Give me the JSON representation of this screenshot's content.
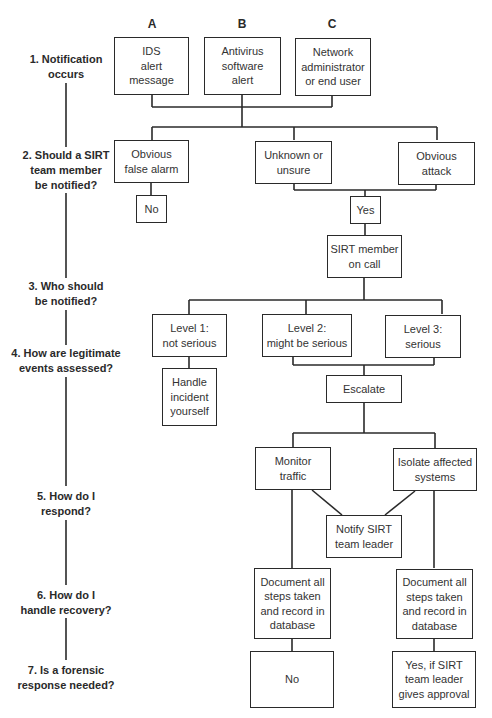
{
  "columns": [
    "A",
    "B",
    "C"
  ],
  "steps": [
    "1. Notification\noccurs",
    "2. Should a SIRT\nteam member\nbe notified?",
    "3. Who should\nbe notified?",
    "4. How are legitimate\nevents assessed?",
    "5. How do I\nrespond?",
    "6. How do I\nhandle recovery?",
    "7. Is a forensic\nresponse needed?"
  ],
  "nodes": {
    "ids_alert": "IDS\nalert\nmessage",
    "antivirus_alert": "Antivirus\nsoftware\nalert",
    "network_admin": "Network\nadministrator\nor end user",
    "false_alarm": "Obvious\nfalse alarm",
    "unknown": "Unknown or\nunsure",
    "obvious_attack": "Obvious\nattack",
    "no_notify": "No",
    "yes_notify": "Yes",
    "sirt_on_call": "SIRT member\non call",
    "level1": "Level 1:\nnot serious",
    "level2": "Level 2:\nmight be serious",
    "level3": "Level 3:\nserious",
    "handle_yourself": "Handle\nincident\nyourself",
    "escalate": "Escalate",
    "monitor_traffic": "Monitor\ntraffic",
    "isolate_systems": "Isolate affected\nsystems",
    "notify_leader": "Notify SIRT\nteam leader",
    "document_left": "Document all\nsteps taken\nand record in\ndatabase",
    "document_right": "Document all\nsteps taken\nand record in\ndatabase",
    "forensic_no": "No",
    "forensic_yes": "Yes, if SIRT\nteam leader\ngives approval"
  },
  "colors": {
    "line": "#2a2a2a",
    "background": "#ffffff"
  }
}
